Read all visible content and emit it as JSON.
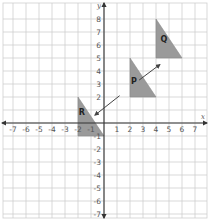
{
  "chart_data": {
    "type": "coordinate-grid",
    "title": "",
    "xlabel": "x",
    "ylabel": "y",
    "xlim": [
      -7.5,
      7.7
    ],
    "ylim": [
      -7.3,
      9
    ],
    "grid": true,
    "x_ticks": [
      -7,
      -6,
      -5,
      -4,
      -3,
      -2,
      -1,
      1,
      2,
      3,
      4,
      5,
      6,
      7
    ],
    "y_ticks": [
      8,
      7,
      6,
      5,
      4,
      3,
      2,
      -1,
      -2,
      -3,
      -4,
      -5,
      -6,
      -7
    ],
    "shapes": [
      {
        "label": "Q",
        "type": "triangle",
        "vertices": [
          [
            4,
            8
          ],
          [
            4,
            5
          ],
          [
            6,
            5
          ]
        ],
        "fill": "#9a9a9a"
      },
      {
        "label": "P",
        "type": "triangle",
        "vertices": [
          [
            2,
            5
          ],
          [
            2,
            2
          ],
          [
            4,
            2
          ]
        ],
        "fill": "#9a9a9a"
      },
      {
        "label": "R",
        "type": "triangle",
        "vertices": [
          [
            -2,
            2
          ],
          [
            -2,
            -1
          ],
          [
            0,
            -1
          ]
        ],
        "fill": "#9a9a9a"
      }
    ],
    "arrows": [
      {
        "from": [
          2.7,
          3.3
        ],
        "to": [
          4.3,
          4.5
        ],
        "description": "arrow pointing from P toward Q"
      },
      {
        "from": [
          1.2,
          2.1
        ],
        "to": [
          -0.7,
          0.6
        ],
        "description": "arrow pointing toward R"
      }
    ]
  },
  "geometry": {
    "origin_px": [
      104,
      123
    ],
    "unit_px": 13
  },
  "colors": {
    "grid": "#cfcfcf",
    "axis": "#333333",
    "triangle_fill": "#9a9a9a",
    "triangle_stroke": "#888888",
    "arrow": "#444444"
  }
}
